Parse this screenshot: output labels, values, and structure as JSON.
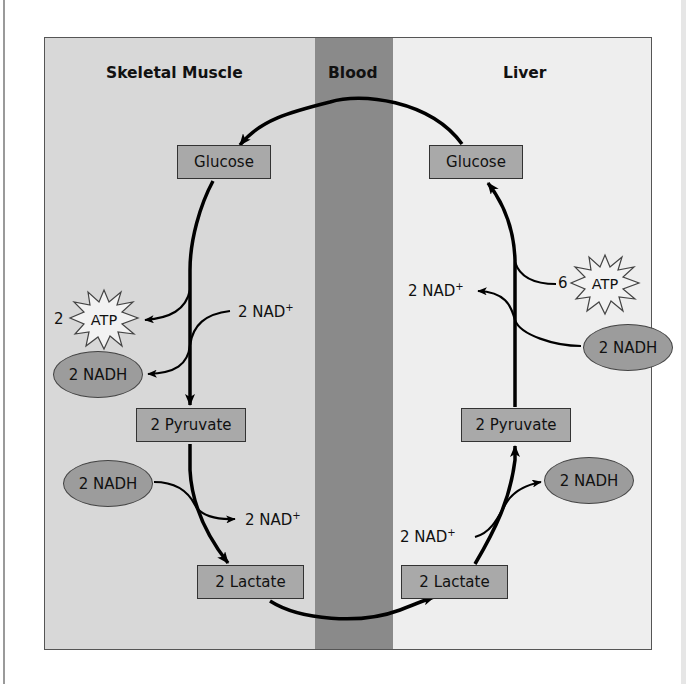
{
  "diagram": {
    "type": "Cori cycle",
    "regions": {
      "muscle": {
        "title": "Skeletal Muscle"
      },
      "blood": {
        "title": "Blood"
      },
      "liver": {
        "title": "Liver"
      }
    },
    "muscle": {
      "glucose": "Glucose",
      "atp_count": "2",
      "atp_label": "ATP",
      "nad_in": "2 NAD",
      "nad_in_sup": "+",
      "nadh_out": "2 NADH",
      "pyruvate": "2 Pyruvate",
      "nadh_in": "2 NADH",
      "nad_out": "2 NAD",
      "nad_out_sup": "+",
      "lactate": "2 Lactate"
    },
    "liver": {
      "glucose": "Glucose",
      "atp_count": "6",
      "atp_label": "ATP",
      "nad_out": "2 NAD",
      "nad_out_sup": "+",
      "nadh_in": "2 NADH",
      "pyruvate": "2 Pyruvate",
      "nadh_out": "2 NADH",
      "nad_in": "2 NAD",
      "nad_in_sup": "+",
      "lactate": "2 Lactate"
    },
    "colors": {
      "muscle_bg": "#d8d8d8",
      "blood_bg": "#8a8a8a",
      "liver_bg": "#eeeeee",
      "box_fill": "#a9a9a9",
      "nadh_fill": "#9c9c9c",
      "atp_fill": "#f2f2f2",
      "arrow": "#000000"
    }
  }
}
